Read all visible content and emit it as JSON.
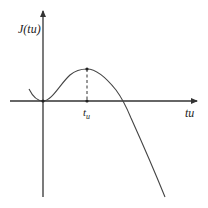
{
  "diagram": {
    "y_axis_label": "J(tu)",
    "x_axis_label": "tu",
    "marker_label": "t",
    "marker_subscript": "u",
    "colors": {
      "axis": "#333333",
      "curve": "#444444",
      "background": "#ffffff"
    }
  }
}
